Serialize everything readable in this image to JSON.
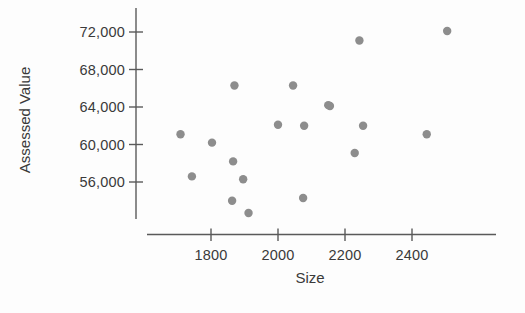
{
  "chart_data": {
    "type": "scatter",
    "title": "",
    "xlabel": "Size",
    "ylabel": "Assessed Value",
    "xlim": [
      1690,
      2560
    ],
    "ylim": [
      52500,
      73200
    ],
    "xticks": [
      1800,
      2000,
      2200,
      2400
    ],
    "xtick_labels": [
      "1800",
      "2000",
      "2200",
      "2400"
    ],
    "yticks": [
      56000,
      60000,
      64000,
      68000,
      72000
    ],
    "ytick_labels": [
      "56,000",
      "60,000",
      "64,000",
      "68,000",
      "72,000"
    ],
    "grid": false,
    "legend": null,
    "marker": {
      "shape": "circle",
      "color": "#8d8d8d",
      "radius_px": 4.2
    },
    "points": [
      {
        "x": 1709,
        "y": 61100
      },
      {
        "x": 1803,
        "y": 60200
      },
      {
        "x": 1743,
        "y": 56600
      },
      {
        "x": 1863,
        "y": 54000
      },
      {
        "x": 1912,
        "y": 52700
      },
      {
        "x": 1870,
        "y": 66300
      },
      {
        "x": 2045,
        "y": 66300
      },
      {
        "x": 2150,
        "y": 64200
      },
      {
        "x": 2000,
        "y": 62100
      },
      {
        "x": 2078,
        "y": 62000
      },
      {
        "x": 1866,
        "y": 58200
      },
      {
        "x": 1896,
        "y": 56300
      },
      {
        "x": 2075,
        "y": 54300
      },
      {
        "x": 2243,
        "y": 71100
      },
      {
        "x": 2155,
        "y": 64100
      },
      {
        "x": 2254,
        "y": 62000
      },
      {
        "x": 2229,
        "y": 59100
      },
      {
        "x": 2444,
        "y": 61100
      },
      {
        "x": 2505,
        "y": 72100
      }
    ]
  },
  "figure": {
    "axes": {
      "y_axis_label": "Assessed Value",
      "x_axis_label": "Size"
    }
  }
}
